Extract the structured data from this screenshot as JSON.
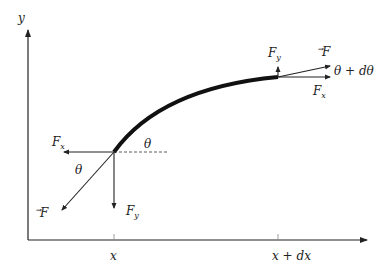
{
  "diagram": {
    "axes": {
      "y_label": "y",
      "x_ticks": [
        "x",
        "x + dx"
      ]
    },
    "left_end": {
      "force_labels": {
        "Fx": "F",
        "Fx_sub": "x",
        "Fy": "F",
        "Fy_sub": "y",
        "F": "F"
      },
      "angle_label": "θ",
      "angle_label_2": "θ"
    },
    "right_end": {
      "force_labels": {
        "Fx": "F",
        "Fx_sub": "x",
        "Fy": "F",
        "Fy_sub": "y",
        "F": "F"
      },
      "angle_label": "θ + dθ"
    },
    "colors": {
      "line": "#222222",
      "curve": "#111111"
    }
  }
}
